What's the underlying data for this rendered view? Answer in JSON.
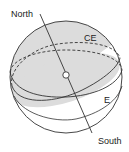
{
  "diagram": {
    "type": "celestial-sphere",
    "labels": {
      "north": "North",
      "south": "South",
      "celestial_equator": "CE",
      "ecliptic": "E"
    },
    "colors": {
      "stroke": "#333333",
      "shade": "#dcdcdc",
      "background": "#ffffff"
    }
  }
}
